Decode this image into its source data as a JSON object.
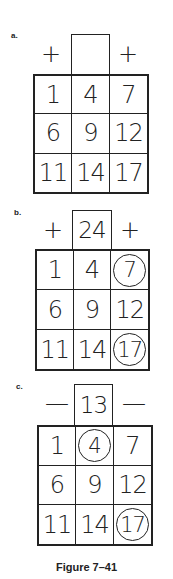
{
  "figure": {
    "caption": "Figure 7–41",
    "panels": [
      {
        "label": "a.",
        "left_op": "+",
        "right_op": "+",
        "top_value": "",
        "grid": [
          "1",
          "4",
          "7",
          "6",
          "9",
          "12",
          "11",
          "14",
          "17"
        ],
        "circled": []
      },
      {
        "label": "b.",
        "left_op": "+",
        "right_op": "+",
        "top_value": "24",
        "grid": [
          "1",
          "4",
          "7",
          "6",
          "9",
          "12",
          "11",
          "14",
          "17"
        ],
        "circled": [
          2,
          8
        ]
      },
      {
        "label": "c.",
        "left_op": "—",
        "right_op": "—",
        "top_value": "13",
        "grid": [
          "1",
          "4",
          "7",
          "6",
          "9",
          "12",
          "11",
          "14",
          "17"
        ],
        "circled": [
          1,
          8
        ]
      }
    ]
  }
}
